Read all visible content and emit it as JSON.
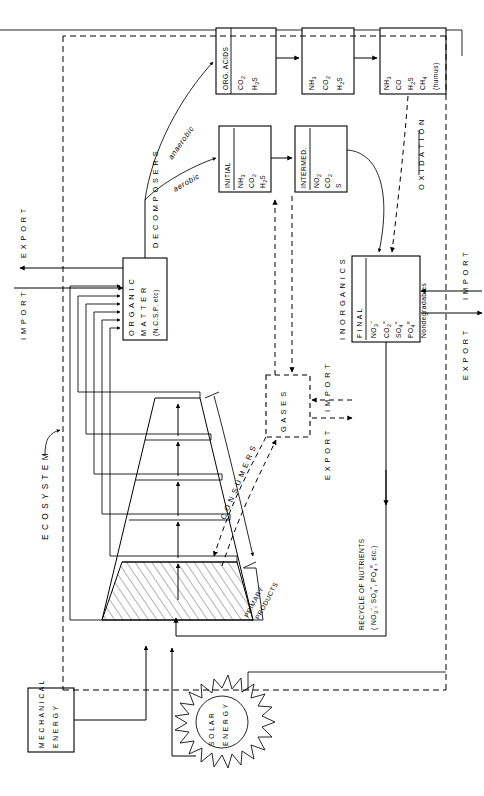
{
  "diagram": {
    "orientation": "rotated-90",
    "boundary_label": "E C O S Y S T E M",
    "boxes": {
      "organic_matter": {
        "name": "ORGANIC MATTER",
        "lines": [
          "O R G A N I C",
          "M A T T E R",
          "(N.C.S.P. etc)"
        ]
      },
      "org_acids": {
        "header": "ORG. ACIDS",
        "items": [
          "CO2",
          "H2S"
        ]
      },
      "nh3_box": {
        "items": [
          "NH3",
          "CO2",
          "H2S"
        ]
      },
      "humus_box": {
        "items": [
          "NH3",
          "CO",
          "H2S",
          "CH4",
          "(humus)"
        ]
      },
      "initial": {
        "header": "INITIAL",
        "items": [
          "NH3",
          "CO2",
          "H2S"
        ]
      },
      "intermed": {
        "header": "INTERMED.",
        "items": [
          "NO2",
          "CO2",
          "S"
        ]
      },
      "inorganics": {
        "name": "I N O R G A N I C S",
        "header": "F I N A L",
        "items": [
          "NO3-",
          "CO2=",
          "SO4=",
          "PO4="
        ]
      },
      "gases": {
        "label": "G A S E S"
      },
      "mechanical_energy": {
        "lines": [
          "M E C H A N I C A L",
          "E N E R G Y"
        ]
      },
      "solar_energy": {
        "lines": [
          "S O L A R",
          "E N E R G Y"
        ]
      }
    },
    "labels": {
      "decomposers": "D E C O M P O S E R S",
      "anaerobic": "anaerobic",
      "aerobic": "aerobic",
      "oxidation": "O X I D A T I O N",
      "consumers": "C O N S U M E R S",
      "primary_products_1": "PRIMARY",
      "primary_products_2": "PRODUCTS",
      "nondegradables": "Nondegradables",
      "recycle_1": "RECYCLE OF NUTRIENTS",
      "recycle_2": "( NO3- , SO4= , PO4= , etc.)",
      "import_left": "I M P O R T",
      "export_left": "E X P O R T",
      "import_right": "I M P O R T",
      "export_right": "E X P O R T",
      "import_gases": "I M P O R T",
      "export_gases": "E X P O R T"
    },
    "colors": {
      "ink": "#000000",
      "paper": "#ffffff"
    }
  }
}
